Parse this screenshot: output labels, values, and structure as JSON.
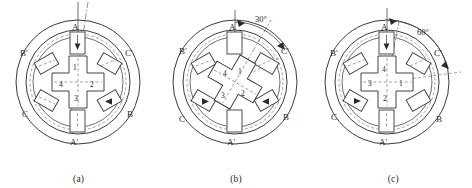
{
  "figure": {
    "kind": "stepper-motor-rotation-sequence",
    "stator_phase_labels": [
      "A",
      "B",
      "C",
      "A'",
      "B'",
      "C'"
    ],
    "rotor_tooth_numbers": [
      "1",
      "2",
      "3",
      "4"
    ],
    "degree_symbol": "°"
  },
  "panels": [
    {
      "caption": "(a)",
      "angle_label": "",
      "rotor_rotation_deg": 0,
      "energized_phase": "A",
      "stator_labels": {
        "top": "A",
        "upper_left": "B'",
        "upper_right": "C'",
        "lower_left": "C",
        "lower_right": "B",
        "bottom": "A'"
      },
      "rotor_numbers": {
        "top": "1",
        "right": "2",
        "bottom": "3",
        "left": "4"
      },
      "excited_poles": [
        "A",
        "A'",
        "B"
      ]
    },
    {
      "caption": "(b)",
      "angle_label": "30°",
      "rotor_rotation_deg": 30,
      "energized_phase": "B",
      "stator_labels": {
        "top": "A",
        "upper_left": "B'",
        "upper_right": "C'",
        "lower_left": "C",
        "lower_right": "B",
        "bottom": "A'"
      },
      "rotor_numbers": {
        "top": "1",
        "right": "2",
        "bottom": "3",
        "left": "4"
      },
      "excited_poles": [
        "B",
        "C"
      ]
    },
    {
      "caption": "(c)",
      "angle_label": "60°",
      "rotor_rotation_deg": 60,
      "energized_phase": "C",
      "stator_labels": {
        "top": "A",
        "upper_left": "B'",
        "upper_right": "C'",
        "lower_left": "C",
        "lower_right": "B",
        "bottom": "A'"
      },
      "rotor_numbers": {
        "top": "4",
        "right": "1",
        "bottom": "2",
        "left": "3"
      },
      "excited_poles": [
        "A",
        "C"
      ]
    }
  ]
}
